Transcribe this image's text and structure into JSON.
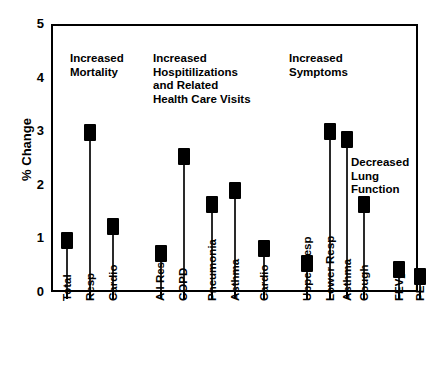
{
  "chart_data": {
    "type": "bar",
    "title": "",
    "xlabel": "",
    "ylabel": "% Change",
    "ylim": [
      0,
      5
    ],
    "yticks": [
      0,
      1,
      2,
      3,
      4,
      5
    ],
    "grid": false,
    "legend": "none",
    "categories": [
      "Total",
      "Resp",
      "Cardio",
      "All Resp",
      "COPD",
      "Pneumonia",
      "Asthma",
      "Cardio",
      "Upper Resp",
      "Lower Resp",
      "Asthma",
      "Cough",
      "FEV1",
      "PEV"
    ],
    "values": [
      0.92,
      2.93,
      1.18,
      0.68,
      2.5,
      1.6,
      1.85,
      0.78,
      0.5,
      2.95,
      2.8,
      1.6,
      0.38,
      0.25
    ],
    "groups": [
      {
        "label": "Increased\nMortality",
        "categories": [
          "Total",
          "Resp",
          "Cardio"
        ]
      },
      {
        "label": "Increased\nHospitilizations\nand Related\nHealth Care Visits",
        "categories": [
          "All Resp",
          "COPD",
          "Pneumonia",
          "Asthma",
          "Cardio"
        ]
      },
      {
        "label": "Increased\nSymptoms",
        "categories": [
          "Upper Resp",
          "Lower Resp",
          "Asthma",
          "Cough"
        ]
      },
      {
        "label": "Decreased\nLung\nFunction",
        "categories": [
          "FEV1",
          "PEV"
        ]
      }
    ],
    "annotations": [
      "Increased Mortality",
      "Increased Hospitilizations and Related Health Care Visits",
      "Increased Symptoms",
      "Decreased Lung Function"
    ],
    "marker_color": "#000000",
    "stem_color": "#2a2a2a",
    "axis_color": "#000000",
    "background_color": "#ffffff"
  },
  "axis": {
    "y_title": "% Change",
    "ticks": {
      "t0": "0",
      "t1": "1",
      "t2": "2",
      "t3": "3",
      "t4": "4",
      "t5": "5"
    }
  },
  "annotations": {
    "mortality_l1": "Increased",
    "mortality_l2": "Mortality",
    "hosp_l1": "Increased",
    "hosp_l2": "Hospitilizations",
    "hosp_l3": "and Related",
    "hosp_l4": "Health Care Visits",
    "symptoms_l1": "Increased",
    "symptoms_l2": "Symptoms",
    "lung_l1": "Decreased",
    "lung_l2": "Lung",
    "lung_l3": "Function"
  },
  "xlabels": {
    "c0": "Total",
    "c1": "Resp",
    "c2": "Cardio",
    "c3": "All Resp",
    "c4": "COPD",
    "c5": "Pneumonia",
    "c6": "Asthma",
    "c7": "Cardio",
    "c8": "Upper Resp",
    "c9": "Lower Resp",
    "c10": "Asthma",
    "c11": "Cough",
    "c12_main": "FEV",
    "c12_sub": "1",
    "c13": "PEV"
  }
}
